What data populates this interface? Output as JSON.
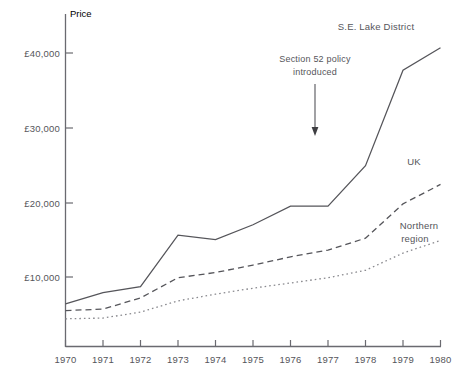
{
  "chart_data": {
    "type": "line",
    "title": "",
    "xlabel": "",
    "ylabel": "Price",
    "x": [
      1970,
      1971,
      1972,
      1973,
      1974,
      1975,
      1976,
      1977,
      1978,
      1979,
      1980
    ],
    "categories": [
      "1970",
      "1971",
      "1972",
      "1973",
      "1974",
      "1975",
      "1976",
      "1977",
      "1978",
      "1979",
      "1980"
    ],
    "xlim": [
      1970,
      1980
    ],
    "ylim": [
      0,
      44000
    ],
    "grid": false,
    "legend_position": "inline-right-end-of-line",
    "ytick_labels": [
      "£10,000",
      "£20,000",
      "£30,000",
      "£40,000"
    ],
    "ytick_values": [
      10000,
      20000,
      30000,
      40000
    ],
    "series": [
      {
        "name": "S.E. Lake District",
        "style": "solid",
        "color": "#55555a",
        "values": [
          6400,
          7900,
          8700,
          15600,
          15000,
          17000,
          19500,
          19500,
          24900,
          37700,
          40700
        ]
      },
      {
        "name": "UK",
        "style": "dashed",
        "color": "#55555a",
        "values": [
          5500,
          5700,
          7200,
          9900,
          10600,
          11600,
          12700,
          13600,
          15200,
          19800,
          22400
        ]
      },
      {
        "name": "Northern region",
        "style": "dotted",
        "color": "#8a8a8f",
        "values": [
          4400,
          4500,
          5300,
          6800,
          7700,
          8500,
          9200,
          9900,
          10900,
          13200,
          14900
        ]
      }
    ],
    "annotations": [
      {
        "text_lines": [
          "Section 52 policy",
          "introduced"
        ],
        "arrow": "down",
        "x": 1977,
        "points_to_y": 29000
      }
    ]
  },
  "icons": {
    "arrow_down": "down-arrow-icon"
  }
}
